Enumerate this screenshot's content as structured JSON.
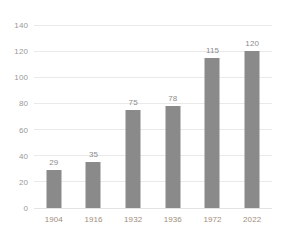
{
  "chart_data": {
    "type": "bar",
    "title": "",
    "title_clipped": true,
    "xlabel": "",
    "ylabel": "",
    "categories": [
      "1904",
      "1916",
      "1932",
      "1936",
      "1972",
      "2022"
    ],
    "values": [
      29,
      35,
      75,
      78,
      115,
      120
    ],
    "value_labels": [
      "29",
      "35",
      "75",
      "78",
      "115",
      "120"
    ],
    "ylim": [
      0,
      140
    ],
    "yticks": [
      0,
      20,
      40,
      60,
      80,
      100,
      120,
      140
    ],
    "ytick_labels": [
      "0",
      "20",
      "40",
      "60",
      "80",
      "100",
      "120",
      "140"
    ],
    "grid": true,
    "grid_axis": "y",
    "legend": false,
    "series": [
      {
        "name": "",
        "values": [
          29,
          35,
          75,
          78,
          115,
          120
        ]
      }
    ]
  },
  "colors": {
    "bar": "#8a8a8a",
    "gridline": "#e9e9e9",
    "baseline": "#e2e2e2",
    "ytick_text": "#9a9a9a",
    "xtick_text": "#a08c7a",
    "value_text": "#8c8c8c",
    "background": "#ffffff"
  }
}
